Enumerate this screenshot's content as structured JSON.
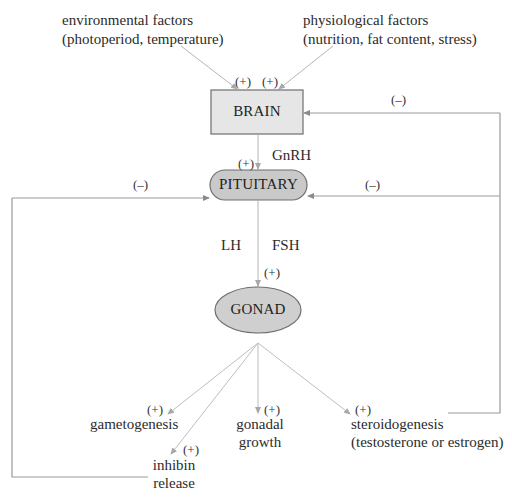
{
  "diagram": {
    "title_cut_off": "",
    "inputs": {
      "environmental": {
        "line1": "environmental factors",
        "line2": "(photoperiod, temperature)",
        "sign": "(+)"
      },
      "physiological": {
        "line1": "physiological factors",
        "line2": "(nutrition, fat content, stress)",
        "sign": "(+)"
      }
    },
    "nodes": {
      "brain": "BRAIN",
      "pituitary": "PITUITARY",
      "gonad": "GONAD"
    },
    "hormones": {
      "gnrh": "GnRH",
      "lh": "LH",
      "fsh": "FSH"
    },
    "signs": {
      "brain_to_pituitary": "(+)",
      "pituitary_to_gonad": "(+)",
      "steroid_feedback_brain": "(–)",
      "steroid_feedback_pituitary": "(–)",
      "inhibin_feedback_pituitary": "(–)"
    },
    "outputs": {
      "gametogenesis": {
        "sign": "(+)",
        "line1": "gametogenesis"
      },
      "inhibin": {
        "sign": "(+)",
        "line1": "inhibin",
        "line2": "release"
      },
      "gonadal_growth": {
        "sign": "(+)",
        "line1": "gonadal",
        "line2": "growth"
      },
      "steroidogenesis": {
        "sign": "(+)",
        "line1": "steroidogenesis",
        "line2": "(testosterone or estrogen)"
      }
    },
    "colors": {
      "node_fill_brain": "#e6e6e6",
      "node_fill_pituitary": "#c9c9c9",
      "node_fill_gonad": "#cfcfcf",
      "node_stroke": "#6e6e6e",
      "arrow": "#b5b5b5",
      "feedback_line": "#9a9a9a"
    }
  }
}
